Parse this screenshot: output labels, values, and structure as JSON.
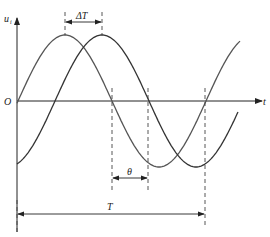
{
  "diagram": {
    "title": "",
    "labels": {
      "y_axis": "u",
      "y_axis_sub": "i",
      "x_axis": "t",
      "origin": "O",
      "delta_t": "ΔT",
      "theta": "θ",
      "period": "T"
    },
    "curves": [
      {
        "name": "curve-1",
        "phase": "leading",
        "color": "#555555"
      },
      {
        "name": "curve-2",
        "phase": "lagging",
        "color": "#333333"
      }
    ]
  }
}
